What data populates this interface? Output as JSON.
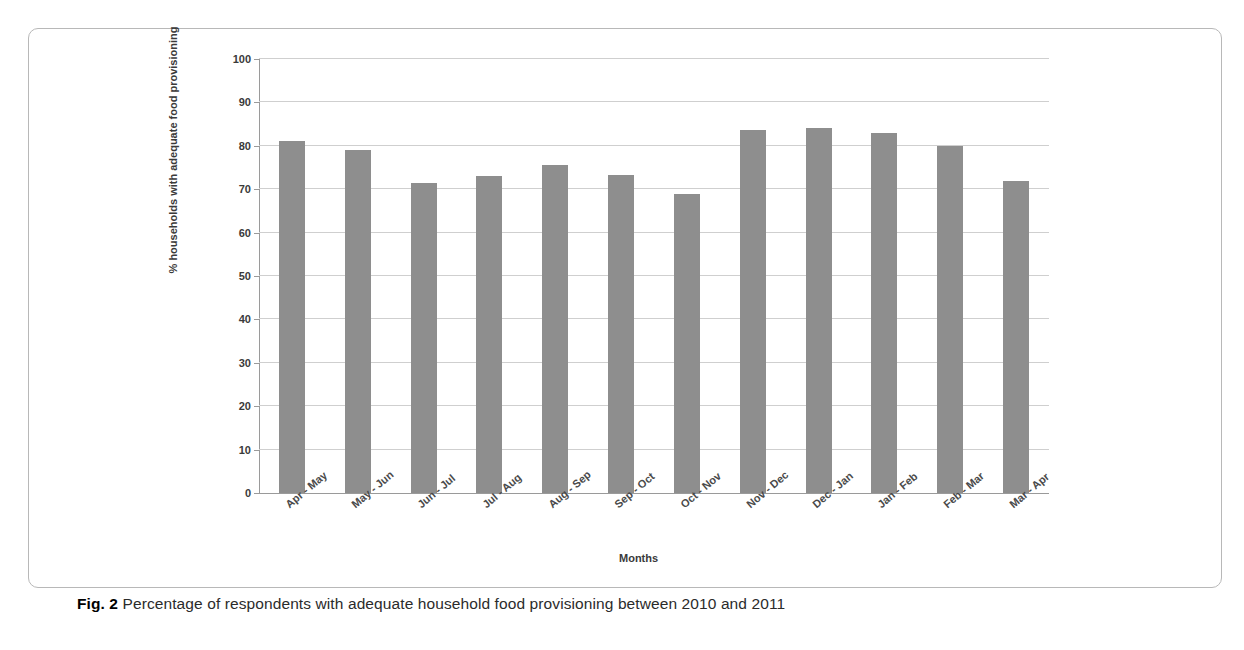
{
  "figure": {
    "caption_label": "Fig. 2",
    "caption_text": "Percentage of respondents with adequate household food provisioning between 2010 and 2011"
  },
  "chart_data": {
    "type": "bar",
    "title": "",
    "xlabel": "Months",
    "ylabel": "% households with adequate food provisioning",
    "ylim": [
      0,
      100
    ],
    "ytick_labels": [
      "0",
      "10",
      "20",
      "30",
      "40",
      "50",
      "60",
      "70",
      "80",
      "90",
      "100"
    ],
    "yticks": [
      0,
      10,
      20,
      30,
      40,
      50,
      60,
      70,
      80,
      90,
      100
    ],
    "grid": true,
    "legend": "none",
    "bar_color": "#8e8e8e",
    "categories": [
      "Apr - May",
      "May - Jun",
      "Jun - Jul",
      "Jul - Aug",
      "Aug - Sep",
      "Sep - Oct",
      "Oct - Nov",
      "Nov - Dec",
      "Dec - Jan",
      "Jan - Feb",
      "Feb - Mar",
      "Mar - Apr"
    ],
    "values": [
      81,
      79,
      71.5,
      73,
      75.5,
      73.3,
      69,
      83.7,
      84,
      83,
      80,
      71.8
    ]
  }
}
